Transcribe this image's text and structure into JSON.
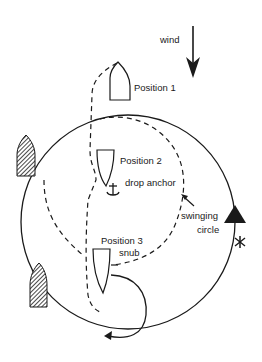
{
  "diagram": {
    "colors": {
      "ink": "#1a1a1a",
      "background": "#ffffff"
    },
    "labels": {
      "wind": "wind",
      "position_1": "Position 1",
      "position_2": "Position 2",
      "drop_anchor": "drop anchor",
      "swinging": "swinging",
      "circle": "circle",
      "position_3": "Position 3",
      "snub": "snub"
    },
    "elements": {
      "wind_arrow": "arrow-down-icon",
      "anchor": "anchor-icon",
      "boat_outline": "boat-outline-icon",
      "moored_boat_hatched": "hatched-boat-icon",
      "buoy": "triangle-marker-icon",
      "star_marker": "asterisk-marker-icon"
    }
  }
}
